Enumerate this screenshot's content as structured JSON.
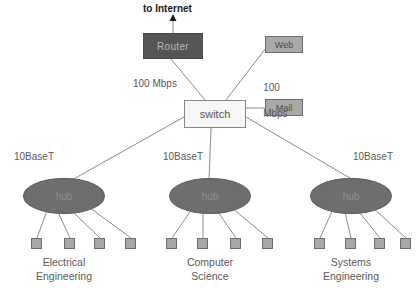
{
  "diagram": {
    "title_text": "to Internet",
    "nodes": {
      "router": {
        "label": "Router",
        "fill": "#555555",
        "text_color": "#b9b9b9"
      },
      "web": {
        "label": "Web",
        "fill": "#a8a8a8"
      },
      "mail": {
        "label": "Mail",
        "fill": "#a8a8a8"
      },
      "switch": {
        "label": "switch",
        "fill": "#f7f7f7"
      },
      "hubs": [
        {
          "label": "hub",
          "fill": "#6e6e6e"
        },
        {
          "label": "hub",
          "fill": "#6e6e6e"
        },
        {
          "label": "hub",
          "fill": "#6e6e6e"
        }
      ]
    },
    "link_labels": {
      "router_link": "100 Mbps",
      "web_link_line1": "100",
      "web_link_line2": "Mbps",
      "hub_link_1": "10BaseT",
      "hub_link_2": "10BaseT",
      "hub_link_3": "10BaseT"
    },
    "departments": [
      {
        "line1": "Electrical",
        "line2": "Engineering",
        "host_count": 4
      },
      {
        "line1": "Computer",
        "line2": "Science",
        "host_count": 4
      },
      {
        "line1": "Systems",
        "line2": "Engineering",
        "host_count": 4
      }
    ],
    "colors": {
      "background": "#ffffff",
      "edge": "#8c8c8c",
      "text": "#5a5a5a",
      "title_text": "#1a1a1a"
    }
  }
}
